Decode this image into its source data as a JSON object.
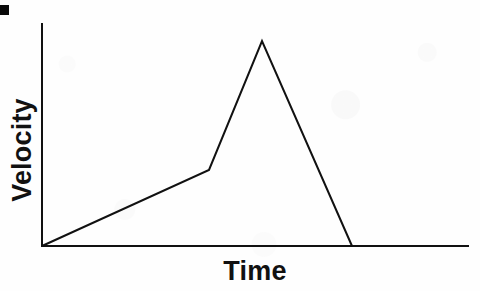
{
  "figure": {
    "corner_mark": "black-square-marker"
  },
  "chart_data": {
    "type": "line",
    "title": "",
    "subtitle": "",
    "xlabel": "Time",
    "ylabel": "Velocity",
    "x": [
      0,
      0.4,
      0.52,
      0.73
    ],
    "y": [
      0,
      0.34,
      0.92,
      0
    ],
    "series": [
      {
        "name": "velocity",
        "points": [
          {
            "x": 0,
            "y": 0,
            "note": "origin, at rest"
          },
          {
            "x": 0.4,
            "y": 0.34,
            "note": "kink, slope increases"
          },
          {
            "x": 0.52,
            "y": 0.92,
            "note": "peak velocity"
          },
          {
            "x": 0.73,
            "y": 0,
            "note": "returns to rest"
          }
        ]
      }
    ],
    "xlim": [
      0,
      1
    ],
    "ylim": [
      0,
      1
    ],
    "xticks": [],
    "yticks": [],
    "xticklabels": [],
    "yticklabels": [],
    "grid": false,
    "legend": false,
    "legend_position": "none",
    "annotations": [],
    "colors": {
      "line": "#111111",
      "axis": "#111111",
      "background": "#fefefe",
      "text": "#111111"
    },
    "geometry_px": {
      "origin": [
        42,
        246
      ],
      "y_axis_top": [
        42,
        24
      ],
      "x_axis_right": [
        468,
        246
      ],
      "kink": [
        209,
        170
      ],
      "peak": [
        262,
        41
      ],
      "landing": [
        352,
        246
      ],
      "stroke_width": 2
    }
  }
}
